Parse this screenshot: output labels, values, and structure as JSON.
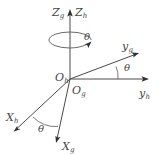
{
  "figure": {
    "type": "coordinate-frame-rotation-diagram",
    "background_color": "#ffffff",
    "line_color": "#4a4a4a",
    "text_color": "#454545",
    "width": 160,
    "height": 155
  },
  "labels": {
    "z_g": {
      "base": "Z",
      "sub": "g"
    },
    "z_h": {
      "base": "Z",
      "sub": "h"
    },
    "y_g": {
      "base": "y",
      "sub": "g"
    },
    "y_h": {
      "base": "y",
      "sub": "h"
    },
    "x_g": {
      "base": "X",
      "sub": "g"
    },
    "x_h": {
      "base": "X",
      "sub": "h"
    },
    "o_g": {
      "base": "O",
      "sub": "g"
    },
    "o_h": {
      "base": "O",
      "sub": "h"
    }
  },
  "angles": {
    "spin": "θ",
    "y_axis": "θ",
    "x_axis": "θ"
  },
  "geometry": {
    "origin": {
      "x": 70,
      "y": 79
    },
    "z_axis_tip": {
      "x": 70,
      "y": 10
    },
    "y_h_tip": {
      "x": 148,
      "y": 79
    },
    "y_g_tip": {
      "x": 138,
      "y": 53
    },
    "x_h_tip": {
      "x": 14,
      "y": 131
    },
    "x_g_tip": {
      "x": 56,
      "y": 142
    },
    "spin_ellipse": {
      "cx": 70,
      "cy": 40,
      "rx": 21,
      "ry": 8
    }
  }
}
